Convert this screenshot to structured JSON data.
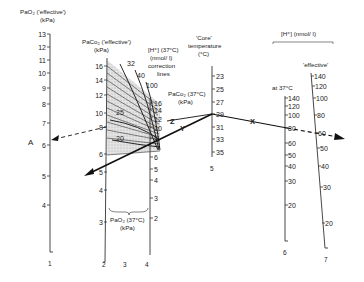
{
  "scales": {
    "s1": {
      "number": "1",
      "title_line1": "PaO₂ ('effective')",
      "title_line2": "(kPa)",
      "ticks": [
        "13",
        "12",
        "11",
        "10",
        "9",
        "8",
        "7",
        "6",
        "5",
        "4"
      ]
    },
    "s2": {
      "number": "2",
      "title_line1": "PaCo₂ ('effective')",
      "title_line2": "(kPa)",
      "ticks": [
        "16",
        "14",
        "12",
        "10",
        "8",
        "6",
        "5",
        "4",
        "3"
      ]
    },
    "s3": {
      "number": "3",
      "title_line1": "[H⁺] (37°C)",
      "title_line2": "(nmol/ l)",
      "title_line3": "correction",
      "title_line4": "lines",
      "curve_labels": [
        "32",
        "40",
        "100",
        "25",
        "20"
      ]
    },
    "s4": {
      "number": "4",
      "title_line1": "PaCo₂ (37°C)",
      "title_line2": "(kPa)",
      "ticks_top": [
        "16",
        "14",
        "12",
        "10",
        "8",
        "6",
        "5",
        "4",
        "3",
        "2"
      ],
      "bottom_title_line1": "PaO₂ (37°C)",
      "bottom_title_line2": "(kPa)"
    },
    "s5": {
      "number": "5",
      "title_line1": "'Core'",
      "title_line2": "temperature",
      "title_line3": "(°C)",
      "ticks": [
        "23",
        "25",
        "27",
        "29",
        "31",
        "33",
        "35"
      ]
    },
    "s6": {
      "number": "6",
      "title": "at 37°C",
      "ticks": [
        "140",
        "120",
        "100",
        "80",
        "60",
        "50",
        "40",
        "30",
        "20"
      ]
    },
    "s7": {
      "number": "7",
      "title": "'effective'",
      "ticks": [
        "140",
        "120",
        "100",
        "80",
        "60",
        "50",
        "40",
        "30",
        "20"
      ]
    },
    "group_title": "[H⁺]  (nmol/ l)"
  },
  "annotations": {
    "A": "A",
    "X": "X",
    "Y": "Y",
    "Z": "Z"
  }
}
